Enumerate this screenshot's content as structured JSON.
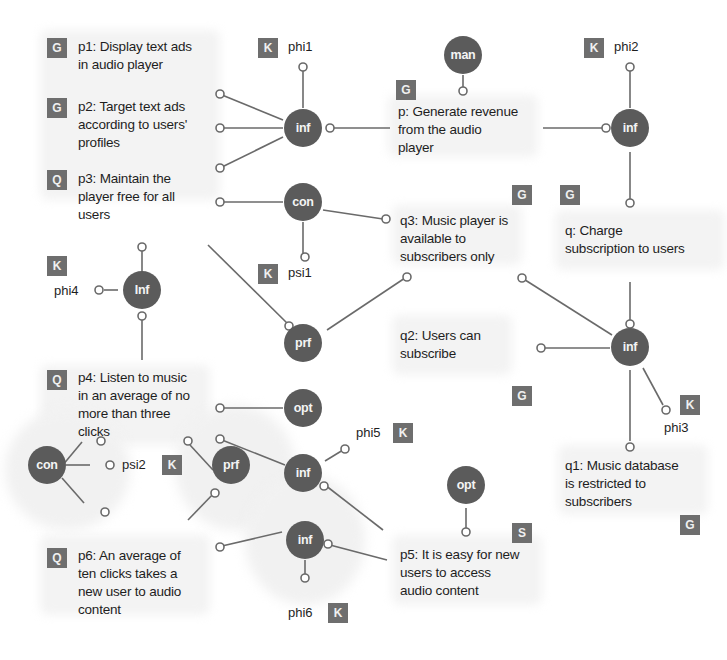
{
  "diagram": {
    "type": "goal-model",
    "colors": {
      "node": "#5b5b5b",
      "badge": "#6e6e6e",
      "wire": "#6a6a6a",
      "background_blob": "#f1f1f1"
    },
    "propositions": [
      {
        "id": "p1",
        "badge": "G",
        "text": "p1: Display text ads\nin audio player"
      },
      {
        "id": "p2",
        "badge": "G",
        "text": "p2: Target text ads\naccording to users'\nprofiles"
      },
      {
        "id": "p3",
        "badge": "Q",
        "text": "p3: Maintain the\nplayer free for all\nusers"
      },
      {
        "id": "p4",
        "badge": "Q",
        "text": "p4: Listen to music\nin an average of no\nmore than three\nclicks"
      },
      {
        "id": "p6",
        "badge": "Q",
        "text": "p6: An average of\nten clicks takes a\nnew user to audio\ncontent"
      },
      {
        "id": "p",
        "badge": "G",
        "text": "p: Generate revenue\nfrom the audio\nplayer"
      },
      {
        "id": "q3",
        "badge": "G",
        "text": "q3: Music player is\navailable to\nsubscribers only"
      },
      {
        "id": "q2",
        "badge": "G",
        "text": "q2: Users can\nsubscribe"
      },
      {
        "id": "p5",
        "badge": "S",
        "text": "p5: It is easy for new\nusers to access\naudio content"
      },
      {
        "id": "q",
        "badge": "G",
        "text": "q: Charge\nsubscription to users"
      },
      {
        "id": "q1",
        "badge": "G",
        "text": "q1: Music database\nis restricted to\nsubscribers"
      }
    ],
    "knowledge": [
      {
        "id": "phi1",
        "badge": "K",
        "text": "phi1"
      },
      {
        "id": "phi2",
        "badge": "K",
        "text": "phi2"
      },
      {
        "id": "phi3",
        "badge": "K",
        "text": "phi3"
      },
      {
        "id": "phi4",
        "badge": "K",
        "text": "phi4"
      },
      {
        "id": "phi5",
        "badge": "K",
        "text": "phi5"
      },
      {
        "id": "phi6",
        "badge": "K",
        "text": "phi6"
      },
      {
        "id": "psi1",
        "badge": "K",
        "text": "psi1"
      },
      {
        "id": "psi2",
        "badge": "K",
        "text": "psi2"
      }
    ],
    "relations": [
      {
        "id": "inf1",
        "label": "inf"
      },
      {
        "id": "con1",
        "label": "con"
      },
      {
        "id": "prf1",
        "label": "prf"
      },
      {
        "id": "opt1",
        "label": "opt"
      },
      {
        "id": "inf2",
        "label": "inf"
      },
      {
        "id": "inf3",
        "label": "inf"
      },
      {
        "id": "Inf4",
        "label": "Inf"
      },
      {
        "id": "con2",
        "label": "con"
      },
      {
        "id": "prf2",
        "label": "prf"
      },
      {
        "id": "man1",
        "label": "man"
      },
      {
        "id": "opt2",
        "label": "opt"
      },
      {
        "id": "inf5",
        "label": "inf"
      },
      {
        "id": "inf6",
        "label": "inf"
      }
    ]
  }
}
